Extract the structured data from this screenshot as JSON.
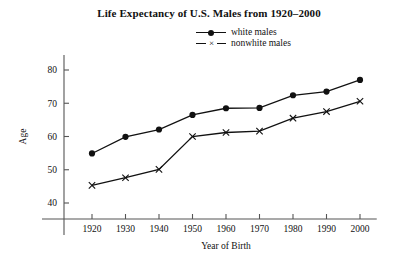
{
  "chart_data": {
    "type": "line",
    "title": "Life Expectancy of U.S. Males from 1920–2000",
    "xlabel": "Year of Birth",
    "ylabel": "Age",
    "x": [
      1920,
      1930,
      1940,
      1950,
      1960,
      1970,
      1980,
      1990,
      2000
    ],
    "xtick_labels": [
      "1920",
      "1930",
      "1940",
      "1950",
      "1960",
      "1970",
      "1980",
      "1990",
      "2000"
    ],
    "ytick_labels": [
      "40",
      "50",
      "60",
      "70",
      "80"
    ],
    "yticks": [
      40,
      50,
      60,
      70,
      80
    ],
    "xlim": [
      1915,
      2005
    ],
    "ylim": [
      36,
      84
    ],
    "grid": false,
    "legend_position": "top-center",
    "series": [
      {
        "name": "white males",
        "marker": "filled-circle",
        "color": "#111111",
        "values": [
          54.9,
          59.9,
          62.1,
          66.5,
          68.5,
          68.6,
          72.4,
          73.5,
          77.0
        ]
      },
      {
        "name": "nonwhite males",
        "marker": "x",
        "color": "#111111",
        "values": [
          45.3,
          47.6,
          50.1,
          60.0,
          61.2,
          61.6,
          65.5,
          67.5,
          70.6
        ]
      }
    ]
  },
  "legend": {
    "items": [
      {
        "label": "white males",
        "marker": "filled-circle"
      },
      {
        "label": "nonwhite males",
        "marker": "x"
      }
    ]
  }
}
